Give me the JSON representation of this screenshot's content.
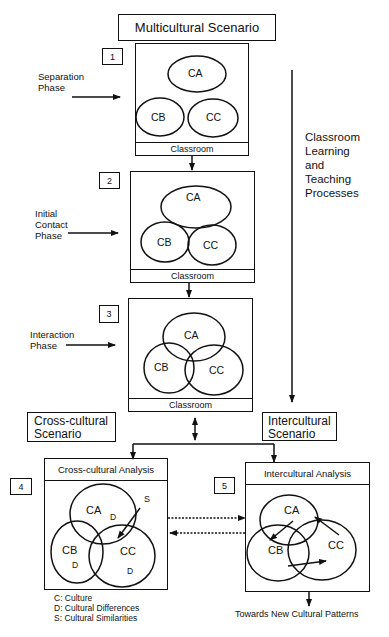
{
  "title": "Multicultural Scenario",
  "side_process_label": [
    "Classroom",
    "Learning",
    "and",
    "Teaching",
    "Processes"
  ],
  "stages": [
    {
      "number": "1",
      "phase": [
        "Separation",
        "Phase"
      ],
      "footer": "Classroom",
      "circles": [
        "CA",
        "CB",
        "CC"
      ]
    },
    {
      "number": "2",
      "phase": [
        "Initial",
        "Contact",
        "Phase"
      ],
      "footer": "Classroom",
      "circles": [
        "CA",
        "CB",
        "CC"
      ]
    },
    {
      "number": "3",
      "phase": [
        "Interaction",
        "Phase"
      ],
      "footer": "Classroom",
      "circles": [
        "CA",
        "CB",
        "CC"
      ]
    }
  ],
  "cross_cultural": {
    "scenario_label": [
      "Cross-cultural",
      "Scenario"
    ],
    "number": "4",
    "panel_title": "Cross-cultural Analysis",
    "circles": [
      "CA",
      "CB",
      "CC"
    ],
    "differences_marker": "D",
    "similarities_marker": "S"
  },
  "intercultural": {
    "scenario_label": [
      "Intercultural",
      "Scenario"
    ],
    "number": "5",
    "panel_title": "Intercultural Analysis",
    "circles": [
      "CA",
      "CB",
      "CC"
    ],
    "outcome": "Towards New Cultural Patterns"
  },
  "legend": [
    "C: Culture",
    "D: Cultural Differences",
    "S: Cultural Similarities"
  ]
}
